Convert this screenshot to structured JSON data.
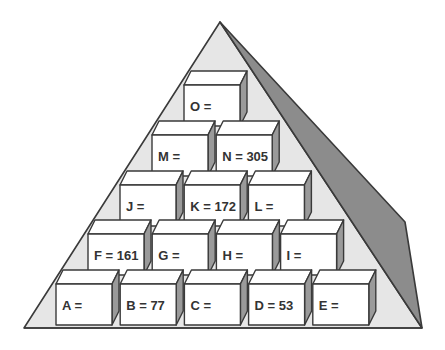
{
  "diagram": {
    "type": "number-pyramid",
    "colors": {
      "background": "#ffffff",
      "pyramid_face": "#e6e6e6",
      "pyramid_shadow": "#8c8c8c",
      "outline": "#3a3a3a",
      "block_front": "#ffffff",
      "block_top": "#ffffff",
      "block_side": "#9a9a9a",
      "text": "#333333"
    },
    "rows": [
      {
        "row": 1,
        "blocks": [
          {
            "id": "O",
            "label": "O =",
            "value": null
          }
        ]
      },
      {
        "row": 2,
        "blocks": [
          {
            "id": "M",
            "label": "M =",
            "value": null
          },
          {
            "id": "N",
            "label": "N = 305",
            "value": 305
          }
        ]
      },
      {
        "row": 3,
        "blocks": [
          {
            "id": "J",
            "label": "J =",
            "value": null
          },
          {
            "id": "K",
            "label": "K = 172",
            "value": 172
          },
          {
            "id": "L",
            "label": "L =",
            "value": null
          }
        ]
      },
      {
        "row": 4,
        "blocks": [
          {
            "id": "F",
            "label": "F = 161",
            "value": 161
          },
          {
            "id": "G",
            "label": "G =",
            "value": null
          },
          {
            "id": "H",
            "label": "H =",
            "value": null
          },
          {
            "id": "I",
            "label": "I =",
            "value": null
          }
        ]
      },
      {
        "row": 5,
        "blocks": [
          {
            "id": "A",
            "label": "A =",
            "value": null
          },
          {
            "id": "B",
            "label": "B = 77",
            "value": 77
          },
          {
            "id": "C",
            "label": "C =",
            "value": null
          },
          {
            "id": "D",
            "label": "D = 53",
            "value": 53
          },
          {
            "id": "E",
            "label": "E =",
            "value": null
          }
        ]
      }
    ]
  }
}
